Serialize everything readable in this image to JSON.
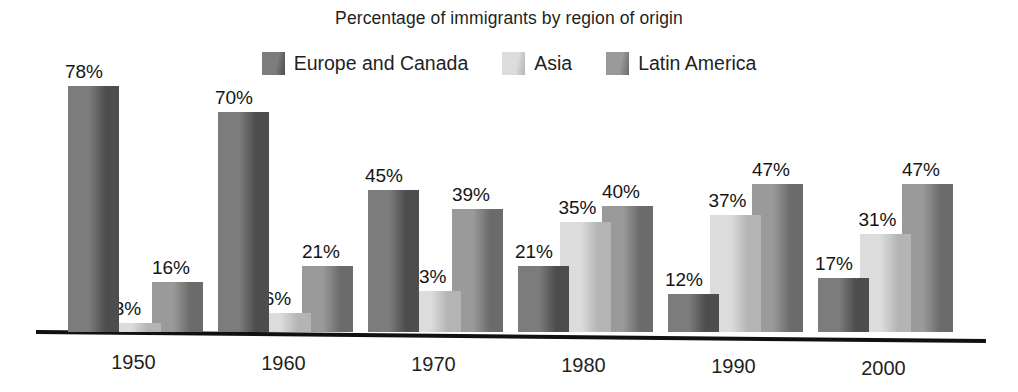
{
  "chart_data": {
    "type": "bar",
    "title": "Percentage of immigrants by region of origin",
    "xlabel": "",
    "ylabel": "",
    "ylim": [
      0,
      80
    ],
    "grid": false,
    "legend_position": "top-center",
    "value_suffix": "%",
    "categories": [
      "1950",
      "1960",
      "1970",
      "1980",
      "1990",
      "2000"
    ],
    "series": [
      {
        "name": "Europe and Canada",
        "color": "#7c7c7c",
        "side_color": "#4d4d4d",
        "top_color": "#606060",
        "values": [
          78,
          70,
          45,
          21,
          12,
          17
        ],
        "labels": [
          "78%",
          "70%",
          "45%",
          "21%",
          "12%",
          "17%"
        ]
      },
      {
        "name": "Asia",
        "color": "#dcdcdc",
        "side_color": "#b4b4b4",
        "top_color": "#c8c8c8",
        "values": [
          3,
          6,
          13,
          35,
          37,
          31
        ],
        "labels": [
          "3%",
          "6%",
          "13%",
          "35%",
          "37%",
          "31%"
        ]
      },
      {
        "name": "Latin America",
        "color": "#9a9a9a",
        "side_color": "#6b6b6b",
        "top_color": "#818181",
        "values": [
          16,
          21,
          39,
          40,
          47,
          47
        ],
        "labels": [
          "16%",
          "21%",
          "39%",
          "40%",
          "47%",
          "47%"
        ]
      }
    ]
  },
  "legend": {
    "items": [
      {
        "label": "Europe and Canada"
      },
      {
        "label": "Asia"
      },
      {
        "label": "Latin America"
      }
    ]
  },
  "axis": {
    "tick_labels": [
      "1950",
      "1960",
      "1970",
      "1980",
      "1990",
      "2000"
    ],
    "line_color": "#111111"
  }
}
